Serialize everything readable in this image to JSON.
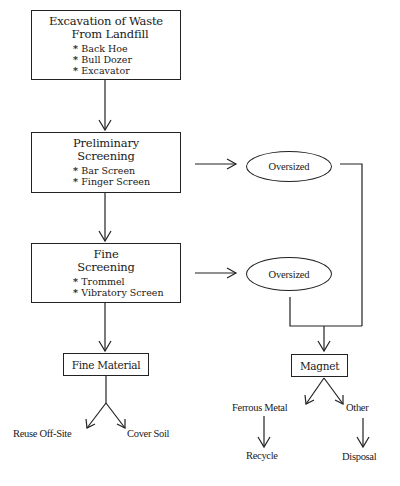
{
  "diagram": {
    "type": "flowchart",
    "steps": [
      {
        "id": "excavation",
        "title_line1": "Excavation of Waste",
        "title_line2": "From Landfill",
        "items": [
          "Back Hoe",
          "Bull Dozer",
          "Excavator"
        ]
      },
      {
        "id": "preliminary",
        "title_line1": "Preliminary",
        "title_line2": "Screening",
        "items": [
          "Bar Screen",
          "Finger Screen"
        ]
      },
      {
        "id": "fine",
        "title_line1": "Fine",
        "title_line2": "Screening",
        "items": [
          "Trommel",
          "Vibratory Screen"
        ]
      }
    ],
    "oversized_1": "Oversized",
    "oversized_2": "Oversized",
    "fine_material": "Fine Material",
    "magnet": "Magnet",
    "fine_outputs": [
      "Reuse Off-Site",
      "Cover Soil"
    ],
    "magnet_outputs": [
      "Ferrous Metal",
      "Other"
    ],
    "final_outputs": [
      "Recycle",
      "Disposal"
    ]
  }
}
